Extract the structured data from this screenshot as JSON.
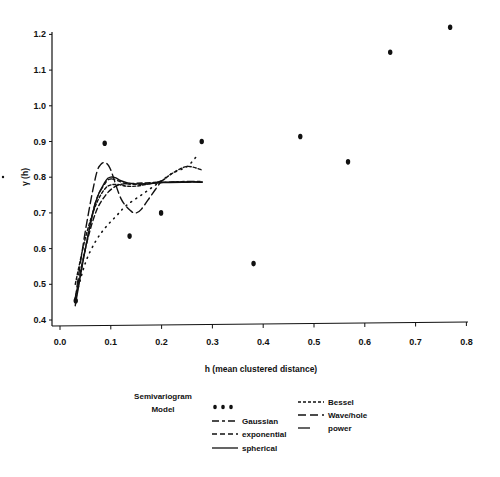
{
  "chart_data": {
    "type": "scatter",
    "title": "",
    "xlabel": "h (mean clustered distance)",
    "ylabel": "γ (h)",
    "xlim": [
      0.0,
      0.8
    ],
    "ylim": [
      0.4,
      1.2
    ],
    "x_ticks": [
      "0.0",
      "0.1",
      "0.2",
      "0.3",
      "0.4",
      "0.5",
      "0.6",
      "0.7",
      "0.8"
    ],
    "y_ticks": [
      "0.4",
      "0.5",
      "0.6",
      "0.7",
      "0.8",
      "0.9",
      "1.0",
      "1.1",
      "1.2"
    ],
    "grid": false,
    "legend_title": "Semivariogram Model",
    "legend_position": "bottom",
    "series": [
      {
        "name": "observed",
        "style": "points",
        "x": [
          0.031,
          0.088,
          0.137,
          0.199,
          0.279,
          0.381,
          0.473,
          0.567,
          0.65,
          0.768
        ],
        "y": [
          0.454,
          0.895,
          0.635,
          0.7,
          0.9,
          0.558,
          0.914,
          0.843,
          1.15,
          1.22
        ]
      },
      {
        "name": "Gaussian",
        "style": "long-short-dash",
        "x": [
          0.03,
          0.05,
          0.07,
          0.09,
          0.1,
          0.11,
          0.13,
          0.15,
          0.2,
          0.25,
          0.28
        ],
        "y": [
          0.45,
          0.6,
          0.73,
          0.785,
          0.795,
          0.792,
          0.782,
          0.78,
          0.785,
          0.788,
          0.788
        ]
      },
      {
        "name": "exponential",
        "style": "dash",
        "x": [
          0.03,
          0.05,
          0.07,
          0.09,
          0.11,
          0.13,
          0.15,
          0.2,
          0.25,
          0.28
        ],
        "y": [
          0.46,
          0.6,
          0.7,
          0.75,
          0.775,
          0.782,
          0.783,
          0.786,
          0.787,
          0.787
        ]
      },
      {
        "name": "spherical",
        "style": "solid",
        "x": [
          0.03,
          0.05,
          0.07,
          0.09,
          0.1,
          0.11,
          0.12,
          0.14,
          0.17,
          0.2,
          0.25,
          0.28
        ],
        "y": [
          0.44,
          0.6,
          0.73,
          0.79,
          0.8,
          0.798,
          0.79,
          0.782,
          0.781,
          0.785,
          0.786,
          0.786
        ]
      },
      {
        "name": "Bessel",
        "style": "short-dash",
        "x": [
          0.03,
          0.05,
          0.07,
          0.09,
          0.11,
          0.13,
          0.15,
          0.17,
          0.2,
          0.22,
          0.25,
          0.28
        ],
        "y": [
          0.5,
          0.63,
          0.72,
          0.77,
          0.78,
          0.775,
          0.775,
          0.78,
          0.79,
          0.81,
          0.83,
          0.82
        ]
      },
      {
        "name": "Wave/hole",
        "style": "long-dash",
        "x": [
          0.03,
          0.05,
          0.07,
          0.08,
          0.09,
          0.1,
          0.12,
          0.14,
          0.15,
          0.16,
          0.18,
          0.2
        ],
        "y": [
          0.46,
          0.65,
          0.8,
          0.835,
          0.84,
          0.82,
          0.74,
          0.705,
          0.7,
          0.71,
          0.75,
          0.79
        ]
      },
      {
        "name": "power",
        "style": "dotted",
        "x": [
          0.03,
          0.05,
          0.07,
          0.09,
          0.11,
          0.13,
          0.16,
          0.19,
          0.22,
          0.25,
          0.27
        ],
        "y": [
          0.46,
          0.56,
          0.62,
          0.66,
          0.69,
          0.72,
          0.75,
          0.78,
          0.81,
          0.83,
          0.86
        ]
      }
    ]
  },
  "legend": {
    "title_line1": "Semivariogram",
    "title_line2": "Model",
    "items": [
      {
        "label": "",
        "style": "points"
      },
      {
        "label": "Gaussian",
        "style": "long-short-dash"
      },
      {
        "label": "exponential",
        "style": "dash"
      },
      {
        "label": "spherical",
        "style": "solid"
      },
      {
        "label": "Bessel",
        "style": "short-dash"
      },
      {
        "label": "Wave/hole",
        "style": "long-dash"
      },
      {
        "label": "power",
        "style": "dotted"
      }
    ]
  },
  "colors": {
    "ink": "#111111",
    "background": "#ffffff"
  }
}
